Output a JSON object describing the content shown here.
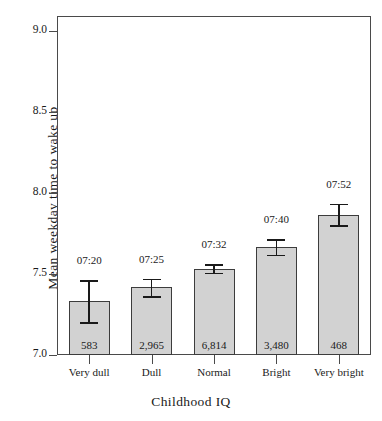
{
  "chart_data": {
    "type": "bar",
    "title": "",
    "xlabel": "Childhood IQ",
    "ylabel": "Mean weekday time to wake up",
    "categories": [
      "Very dull",
      "Dull",
      "Normal",
      "Bright",
      "Very bright"
    ],
    "values": [
      7.333,
      7.417,
      7.533,
      7.667,
      7.867
    ],
    "value_labels": [
      "07:20",
      "07:25",
      "07:32",
      "07:40",
      "07:52"
    ],
    "counts": [
      "583",
      "2,965",
      "6,814",
      "3,480",
      "468"
    ],
    "error_low": [
      7.203,
      7.363,
      7.508,
      7.62,
      7.8
    ],
    "error_high": [
      7.463,
      7.472,
      7.562,
      7.713,
      7.933
    ],
    "ylim": [
      7.0,
      9.0
    ],
    "yticks": [
      "7.0",
      "7.5",
      "8.0",
      "8.5",
      "9.0"
    ],
    "ytick_values": [
      7.0,
      7.5,
      8.0,
      8.5,
      9.0
    ],
    "grid": false,
    "legend": "none",
    "bar_color": "#d2d2d2",
    "bar_edge_color": "#3c3c3c",
    "axis_color": "#4a4a4a",
    "error_bar_color": "#1a1a1a"
  }
}
